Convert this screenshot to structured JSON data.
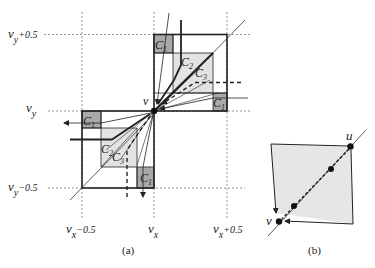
{
  "figure_a": {
    "caption": "(a)",
    "axis_labels": {
      "vy_plus": {
        "base": "v",
        "sub": "y",
        "suffix": "+0.5"
      },
      "vy": {
        "base": "v",
        "sub": "y",
        "suffix": ""
      },
      "vy_minus": {
        "base": "v",
        "sub": "y",
        "suffix": "−0.5"
      },
      "vx_minus": {
        "base": "v",
        "sub": "x",
        "suffix": "−0.5"
      },
      "vx": {
        "base": "v",
        "sub": "x",
        "suffix": ""
      },
      "vx_plus": {
        "base": "v",
        "sub": "x",
        "suffix": "+0.5"
      }
    },
    "vertex_label": "v",
    "region_labels": {
      "c1": {
        "base": "C",
        "sub": "1"
      },
      "c2": {
        "base": "C",
        "sub": "2"
      },
      "c3": {
        "base": "C",
        "sub": "3"
      }
    }
  },
  "figure_b": {
    "caption": "(b)",
    "vertex_u": "u",
    "vertex_v": "v"
  },
  "colors": {
    "light_region": "#e3e3e3",
    "dark_region": "#a9a9a9",
    "line": "#222222",
    "grid": "#777777"
  }
}
